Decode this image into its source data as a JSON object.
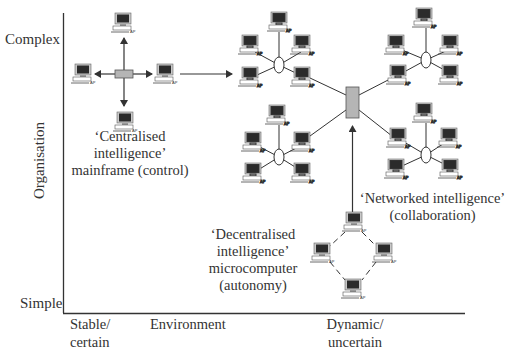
{
  "axes": {
    "y_title": "Organisation",
    "y_top": "Complex",
    "y_bottom": "Simple",
    "x_title": "Environment",
    "x_left_line1": "Stable/",
    "x_left_line2": "certain",
    "x_right_line1": "Dynamic/",
    "x_right_line2": "uncertain"
  },
  "stages": {
    "centralised": {
      "line1": "‘Centralised",
      "line2": "intelligence’",
      "line3": "mainframe (control)"
    },
    "decentralised": {
      "line1": "‘Decentralised",
      "line2": "intelligence’",
      "line3": "microcomputer",
      "line4": "(autonomy)"
    },
    "networked": {
      "line1": "‘Networked intelligence’",
      "line2": "(collaboration)"
    }
  },
  "icons": {
    "computer_label": "AP"
  },
  "colors": {
    "line": "#333333",
    "hub_fill": "#b5b5b5",
    "screen": "#2b2b2b",
    "monitor": "#c9c9c9"
  }
}
